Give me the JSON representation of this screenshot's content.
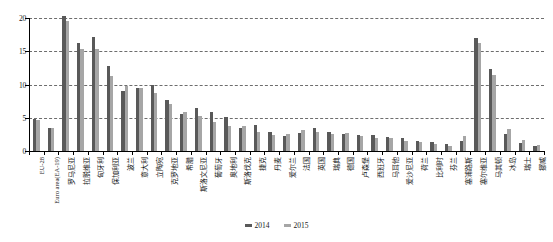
{
  "chart_data": {
    "type": "bar",
    "title": "",
    "xlabel": "",
    "ylabel": "",
    "ylim": [
      0,
      20
    ],
    "yticks": [
      0,
      5,
      10,
      15,
      20
    ],
    "grid": true,
    "legend_position": "bottom",
    "categories": [
      "EU-28",
      "Euro area(EA-19)",
      "罗马尼亚",
      "拉脱维亚",
      "匈牙利",
      "保加利亚",
      "波兰",
      "意大利",
      "立陶宛",
      "克罗地亚",
      "希腊",
      "斯洛文尼亚",
      "葡萄牙",
      "奥地利",
      "斯洛伐克",
      "捷克",
      "丹麦",
      "爱尔兰",
      "法国",
      "英国",
      "瑞典",
      "德国",
      "卢森堡",
      "西班牙",
      "马耳他",
      "爱沙尼亚",
      "荷兰",
      "比利时",
      "芬兰",
      "塞浦路斯",
      "塞尔维亚",
      "马其顿",
      "冰岛",
      "瑞士",
      "挪威"
    ],
    "series": [
      {
        "name": "2014",
        "color": "#595959",
        "values": [
          4.8,
          3.5,
          20.3,
          16.3,
          17.2,
          12.8,
          9.0,
          9.5,
          10.0,
          7.6,
          5.6,
          6.4,
          5.9,
          5.1,
          3.4,
          3.9,
          2.9,
          2.2,
          2.7,
          3.4,
          2.9,
          2.6,
          2.4,
          2.4,
          2.1,
          1.9,
          1.5,
          1.3,
          1.0,
          1.5,
          17.0,
          12.3,
          2.6,
          1.2,
          0.7
        ]
      },
      {
        "name": "2015",
        "color": "#a6a6a6",
        "values": [
          4.7,
          3.5,
          19.6,
          15.3,
          15.3,
          11.3,
          9.8,
          9.5,
          8.7,
          7.1,
          5.9,
          5.3,
          4.4,
          3.8,
          3.8,
          2.9,
          2.4,
          2.6,
          3.2,
          2.9,
          2.5,
          2.7,
          2.3,
          1.9,
          2.0,
          1.5,
          1.3,
          1.1,
          0.8,
          2.2,
          16.2,
          11.5,
          3.3,
          1.7,
          0.9
        ]
      }
    ]
  },
  "legend": {
    "items": [
      {
        "label": "2014",
        "color": "#595959"
      },
      {
        "label": "2015",
        "color": "#a6a6a6"
      }
    ]
  }
}
